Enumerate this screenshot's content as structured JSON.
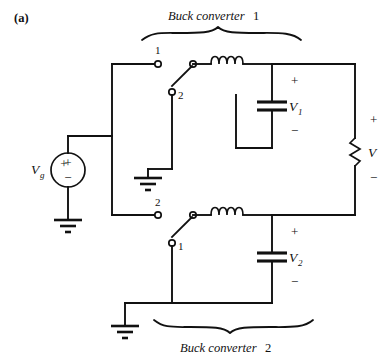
{
  "figure": {
    "panel_label": "(a)",
    "background_color": "#ffffff",
    "line_color": "#111111"
  },
  "groups": {
    "top": {
      "name": "Buck converter",
      "number": "1"
    },
    "bottom": {
      "name": "Buck converter",
      "number": "2"
    }
  },
  "source": {
    "label": "V",
    "subscript": "g",
    "plus": "+",
    "minus": "−"
  },
  "converter1": {
    "switch": {
      "terminal_top_label": "1",
      "terminal_bottom_label": "2"
    },
    "inductor": {
      "name": "inductor-coil"
    },
    "capacitor": {
      "label": "V",
      "subscript": "1",
      "plus": "+",
      "minus": "−"
    }
  },
  "converter2": {
    "switch": {
      "terminal_top_label": "2",
      "terminal_bottom_label": "1"
    },
    "inductor": {
      "name": "inductor-coil"
    },
    "capacitor": {
      "label": "V",
      "subscript": "2",
      "plus": "+",
      "minus": "−"
    }
  },
  "load": {
    "label": "V",
    "plus": "+",
    "minus": "−"
  },
  "grounds": {
    "source_ground": "ground-symbol",
    "converter1_ground": "ground-symbol",
    "converter2_ground": "ground-symbol"
  }
}
